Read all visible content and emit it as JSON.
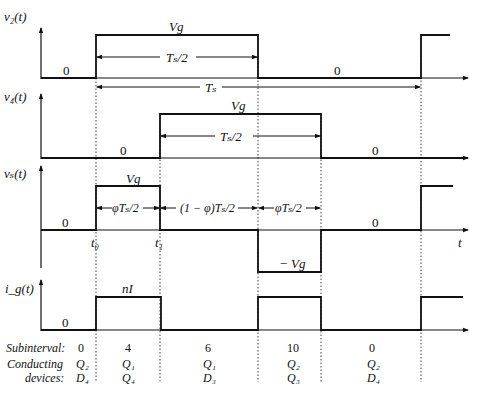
{
  "diagram": {
    "waveforms": [
      {
        "name": "v2",
        "label": "v₂(t)",
        "high_label": "Vg",
        "span_label": "Tₛ/2",
        "zero_labels": [
          "0",
          "0"
        ],
        "period_label": "Tₛ"
      },
      {
        "name": "v4",
        "label": "v₄(t)",
        "high_label": "Vg",
        "span_label": "Tₛ/2",
        "zero_labels": [
          "0",
          "0"
        ]
      },
      {
        "name": "vs",
        "label": "vₛ(t)",
        "high_label": "Vg",
        "low_label": "− Vg",
        "spans": [
          "φTₛ/2",
          "(1 − φ)Tₛ/2",
          "φTₛ/2"
        ],
        "zero_labels": [
          "0",
          "0"
        ],
        "time_marks": [
          "t₀",
          "t₁"
        ],
        "axis_label": "t"
      },
      {
        "name": "ig",
        "label": "iₓ(t)",
        "label_display": "i_g(t)",
        "high_label": "nI",
        "zero_labels": [
          "0"
        ]
      }
    ],
    "table": {
      "row_labels": [
        "Subinterval:",
        "Conducting",
        "devices:"
      ],
      "columns": [
        {
          "subinterval": "0",
          "devices": [
            "Q₂",
            "D₄"
          ]
        },
        {
          "subinterval": "4",
          "devices": [
            "Q₁",
            "Q₄"
          ]
        },
        {
          "subinterval": "6",
          "devices": [
            "Q₁",
            "D₃"
          ]
        },
        {
          "subinterval": "10",
          "devices": [
            "Q₂",
            "Q₃"
          ]
        },
        {
          "subinterval": "0",
          "devices": [
            "Q₂",
            "D₄"
          ]
        }
      ]
    }
  }
}
